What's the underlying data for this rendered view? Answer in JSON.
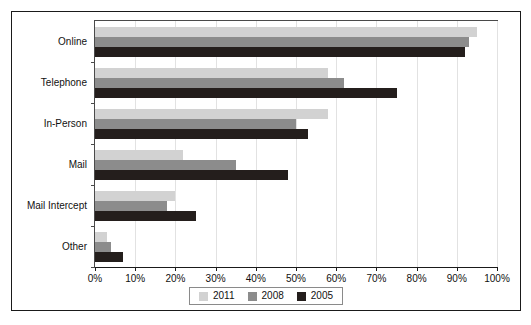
{
  "chart_data": {
    "type": "bar",
    "orientation": "horizontal",
    "title": "",
    "xlabel": "",
    "ylabel": "",
    "xlim": [
      0,
      100
    ],
    "xticks": [
      0,
      10,
      20,
      30,
      40,
      50,
      60,
      70,
      80,
      90,
      100
    ],
    "xticklabels": [
      "0%",
      "10%",
      "20%",
      "30%",
      "40%",
      "50%",
      "60%",
      "70%",
      "80%",
      "90%",
      "100%"
    ],
    "grid": true,
    "legend_position": "bottom-center",
    "categories": [
      "Online",
      "Telephone",
      "In-Person",
      "Mail",
      "Mail Intercept",
      "Other"
    ],
    "series": [
      {
        "name": "2011",
        "color": "#d2d2d2",
        "values": [
          95,
          58,
          58,
          22,
          20,
          3
        ]
      },
      {
        "name": "2008",
        "color": "#8c8c8c",
        "values": [
          93,
          62,
          50,
          35,
          18,
          4
        ]
      },
      {
        "name": "2005",
        "color": "#241e1c",
        "values": [
          92,
          75,
          53,
          48,
          25,
          7
        ]
      }
    ]
  }
}
